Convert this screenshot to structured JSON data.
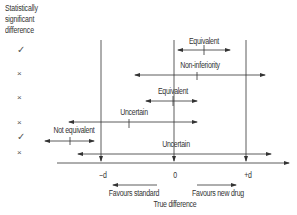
{
  "header": {
    "line1": "Statistically",
    "line2": "significant",
    "line3": "difference"
  },
  "rows": [
    {
      "significant": "✓",
      "label": "Equivalent",
      "start": 178,
      "end": 230,
      "point": 204,
      "y": 50
    },
    {
      "significant": "×",
      "label": "Non-inferiority",
      "start": 135,
      "end": 265,
      "point": 197,
      "y": 75
    },
    {
      "significant": "×",
      "label": "Equivalent",
      "start": 146,
      "end": 197,
      "point": 173,
      "y": 101
    },
    {
      "significant": "×",
      "label": "Uncertain",
      "start": 69,
      "end": 197,
      "point": 129,
      "y": 122
    },
    {
      "significant": "✓",
      "label": "Not equivalent",
      "start": 45,
      "end": 94,
      "point": 70,
      "y": 141
    },
    {
      "significant": "×",
      "label": "Uncertain",
      "start": 78,
      "end": 271,
      "point": null,
      "y": 154
    }
  ],
  "axis": {
    "ticks": [
      {
        "label": "−d",
        "x": 101
      },
      {
        "label": "0",
        "x": 174
      },
      {
        "label": "+d",
        "x": 246
      }
    ],
    "favours_left": "Favours standard",
    "favours_right": "Favours new drug",
    "title": "True difference"
  },
  "colors": {
    "line": "#333333",
    "text": "#333333"
  }
}
